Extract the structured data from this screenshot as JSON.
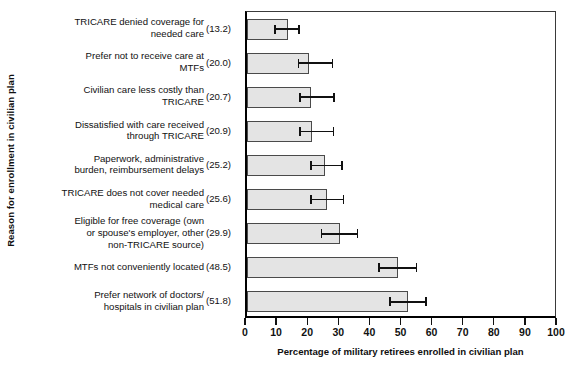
{
  "chart_data": {
    "type": "bar",
    "orientation": "horizontal",
    "title": "",
    "xlabel": "Percentage of military retirees enrolled in civilian plan",
    "ylabel": "Reason for enrollment in civilian plan",
    "xlim": [
      0,
      100
    ],
    "ylim_note": "categorical",
    "grid": false,
    "legend": null,
    "xticks": [
      0,
      10,
      20,
      30,
      40,
      50,
      60,
      70,
      80,
      90,
      100
    ],
    "xticklabels": [
      "0",
      "10",
      "20",
      "30",
      "40",
      "50",
      "60",
      "70",
      "80",
      "90",
      "100"
    ],
    "value_label_format": "(v)",
    "bar_fill_color": "#e4e4e4",
    "bar_edge_color": "#4a4a4a",
    "errorbar_color": "#111111",
    "categories": [
      "TRICARE denied coverage for\nneeded care",
      "Prefer not to receive care at\nMTFs",
      "Civilian care less costly than\nTRICARE",
      "Dissatisfied with care received\nthrough TRICARE",
      "Paperwork, administrative\nburden, reimbursement delays",
      "TRICARE does not cover needed\nmedical care",
      "Eligible for free coverage (own\nor spouse's employer, other\nnon-TRICARE source)",
      "MTFs not conveniently located",
      "Prefer network of doctors/\nhospitals in civilian plan"
    ],
    "values": [
      13.2,
      20.0,
      20.7,
      20.9,
      25.2,
      25.6,
      29.9,
      48.5,
      51.8
    ],
    "value_labels": [
      "(13.2)",
      "(20.0)",
      "(20.7)",
      "(20.9)",
      "(25.2)",
      "(25.6)",
      "(29.9)",
      "(48.5)",
      "(51.8)"
    ],
    "errors_low": [
      9.0,
      16.5,
      17.0,
      17.0,
      20.5,
      20.5,
      24.0,
      42.5,
      46.0
    ],
    "errors_high": [
      16.8,
      27.5,
      28.0,
      27.8,
      30.5,
      31.0,
      35.5,
      54.5,
      57.5
    ]
  }
}
